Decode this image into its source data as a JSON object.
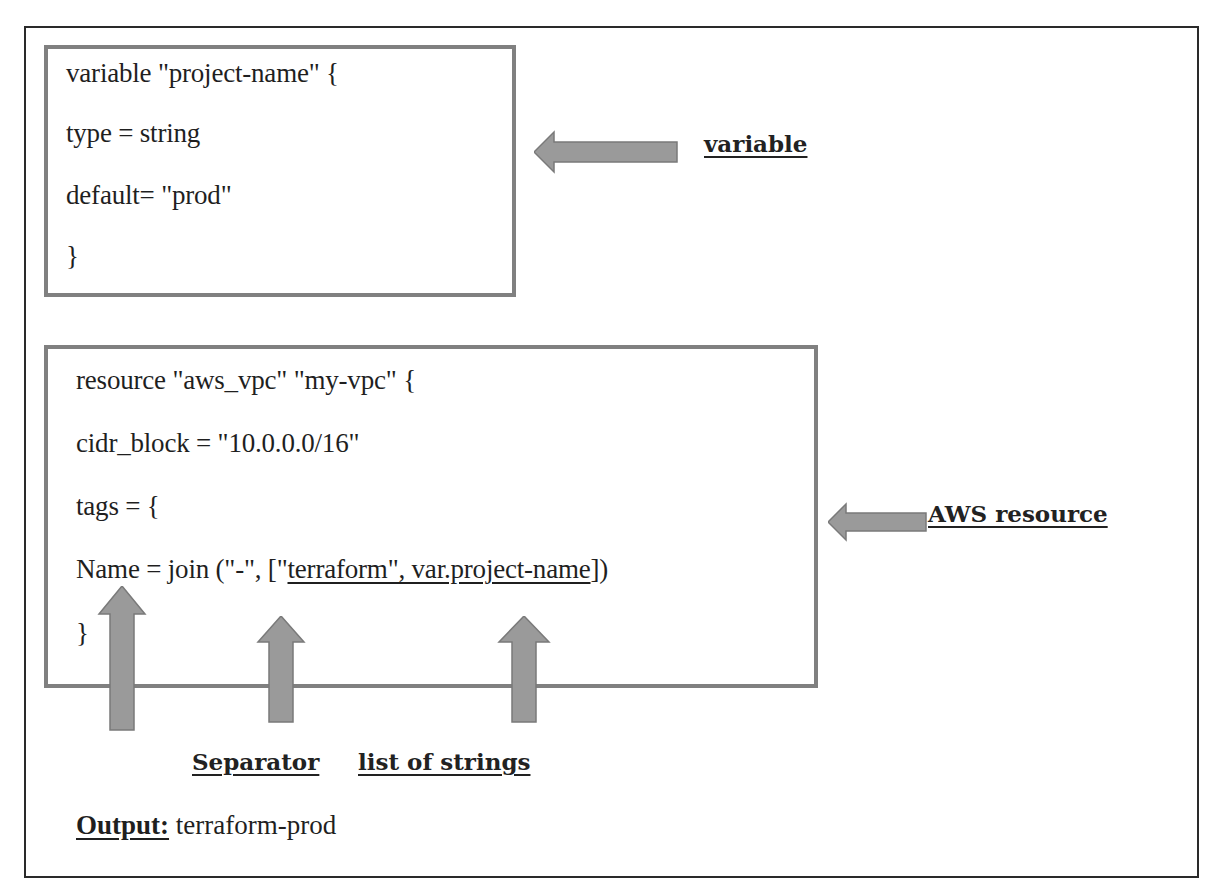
{
  "variable_block": {
    "lines": [
      " variable \"project-name\" {",
      "type = string",
      "default= \"prod\"",
      "}"
    ],
    "annotation": "variable"
  },
  "resource_block": {
    "line1": "resource \"aws_vpc\" \"my-vpc\" {",
    "line2": "cidr_block = \"10.0.0.0/16\"",
    "line3": "tags  = {",
    "line4": {
      "prefix": "Name = join (\"-\", [\"",
      "underlined": "terraform\", var.project-name",
      "suffix": "])"
    },
    "line5": "}",
    "annotation": "AWS resource"
  },
  "pointers": {
    "separator": "Separator",
    "list": "list of strings"
  },
  "output": {
    "label": "Output:",
    "value": " terraform-prod"
  },
  "colors": {
    "box_border": "#808080",
    "arrow_fill": "#9a9a9a",
    "outer_border": "#2a2a2a",
    "text": "#1f1f1f"
  }
}
